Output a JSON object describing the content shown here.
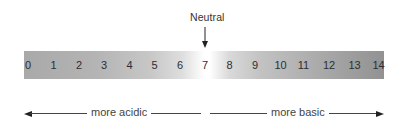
{
  "diagram": {
    "neutral": {
      "label": "Neutral",
      "points_to": "7"
    },
    "scale": {
      "values": [
        "0",
        "1",
        "2",
        "3",
        "4",
        "5",
        "6",
        "7",
        "8",
        "9",
        "10",
        "11",
        "12",
        "13",
        "14"
      ],
      "colors": {
        "left_end": "#a9a9a9",
        "center": "#ffffff",
        "right_end": "#929292"
      }
    },
    "directions": {
      "acidic_label": "more acidic",
      "basic_label": "more basic"
    }
  }
}
